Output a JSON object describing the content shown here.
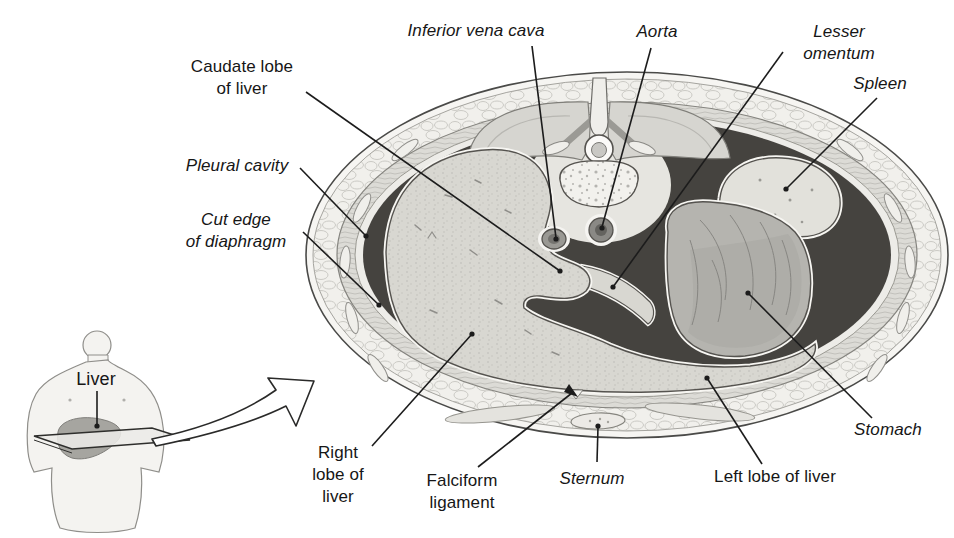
{
  "figure": {
    "inset": {
      "label": "Liver"
    },
    "labels": [
      {
        "id": "caudate-lobe-of-liver",
        "text": "Caudate lobe\nof liver",
        "italic": false
      },
      {
        "id": "pleural-cavity",
        "text": "Pleural cavity",
        "italic": true
      },
      {
        "id": "cut-edge-of-diaphragm",
        "text": "Cut edge\nof diaphragm",
        "italic": true
      },
      {
        "id": "inferior-vena-cava",
        "text": "Inferior vena cava",
        "italic": true
      },
      {
        "id": "aorta",
        "text": "Aorta",
        "italic": true
      },
      {
        "id": "lesser-omentum",
        "text": "Lesser omentum",
        "italic": true
      },
      {
        "id": "spleen",
        "text": "Spleen",
        "italic": true
      },
      {
        "id": "right-lobe-of-liver",
        "text": "Right\nlobe of\nliver",
        "italic": false
      },
      {
        "id": "falciform-ligament",
        "text": "Falciform\nligament",
        "italic": false
      },
      {
        "id": "sternum",
        "text": "Sternum",
        "italic": true
      },
      {
        "id": "left-lobe-of-liver",
        "text": "Left lobe of liver",
        "italic": false
      },
      {
        "id": "stomach",
        "text": "Stomach",
        "italic": true
      }
    ],
    "colors": {
      "background": "#ffffff",
      "ink": "#1c1c1c",
      "body_cavity_dark": "#45433f",
      "liver": "#d8d7d1",
      "stomach": "#b5b4af",
      "spleen": "#e2e1db",
      "fat": "#f1f0ec",
      "muscle": "#dcdbd6",
      "bone": "#f2f1ed"
    }
  }
}
